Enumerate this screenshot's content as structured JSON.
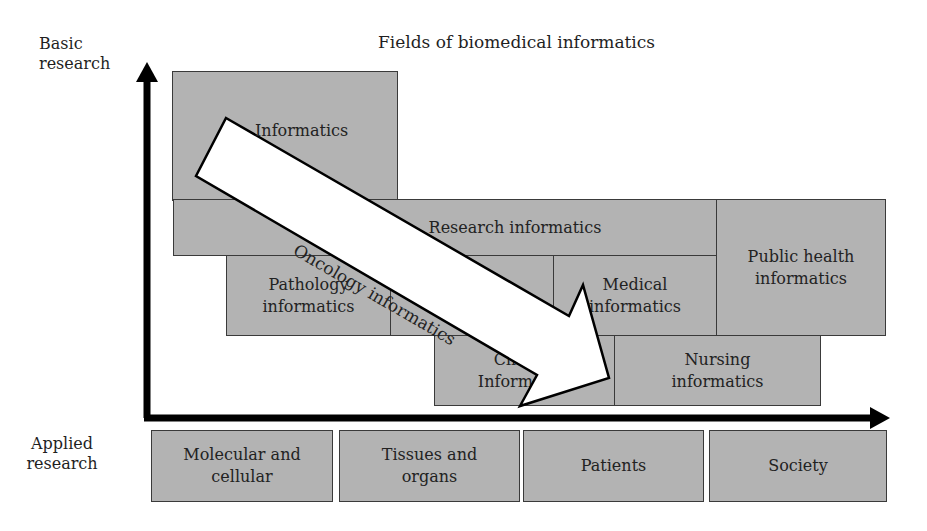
{
  "title": "Fields of biomedical informatics",
  "axes": {
    "y_top_label": "Basic research",
    "y_bottom_label": "Applied research"
  },
  "fields": {
    "informatics": "Informatics",
    "research": "Research informatics",
    "public_health": "Public health informatics",
    "pathology": "Pathology informatics",
    "hidden_middle": "",
    "medical": "Medical informatics",
    "clinical": "Clinical Informatics",
    "nursing": "Nursing informatics"
  },
  "levels": [
    "Molecular and cellular",
    "Tissues and organs",
    "Patients",
    "Society"
  ],
  "overlay_arrow": {
    "label": "Oncology informatics"
  },
  "colors": {
    "box_fill": "#b3b3b3",
    "box_border": "#3a3a3a",
    "axis": "#000000",
    "arrow_fill": "#ffffff"
  }
}
